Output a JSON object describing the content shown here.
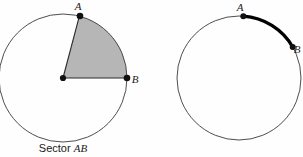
{
  "figure": {
    "background_color": "#fefefe",
    "stroke_color": "#3a3a3a",
    "accent_color": "#000000",
    "sector_fill_color": "#b6b6b6"
  },
  "left_diagram": {
    "name": "sector-diagram",
    "caption_prefix": "Sector ",
    "caption_emphasis": "AB",
    "caption_full": "Sector AB",
    "circle": {
      "cx": 63,
      "cy": 78,
      "r": 64
    },
    "center_point": {
      "label": "",
      "cx": 63,
      "cy": 78
    },
    "points": [
      {
        "label": "A",
        "cx": 80,
        "cy": 16,
        "label_x": 78,
        "label_y": 10
      },
      {
        "label": "B",
        "cx": 127,
        "cy": 78,
        "label_x": 133,
        "label_y": 82
      }
    ],
    "sector": {
      "start_angle_deg": 0,
      "end_angle_deg": 75,
      "fill": "#b6b6b6"
    }
  },
  "right_diagram": {
    "name": "arc-diagram",
    "caption_full": "",
    "circle": {
      "cx": 239,
      "cy": 78,
      "r": 62
    },
    "points": [
      {
        "label": "A",
        "cx": 243,
        "cy": 17,
        "label_x": 240,
        "label_y": 11
      },
      {
        "label": "B",
        "cx": 291,
        "cy": 47,
        "label_x": 294,
        "label_y": 52
      }
    ],
    "arc": {
      "start_angle_deg": 30,
      "end_angle_deg": 86,
      "stroke": "#000000",
      "stroke_width": 3.2
    }
  }
}
